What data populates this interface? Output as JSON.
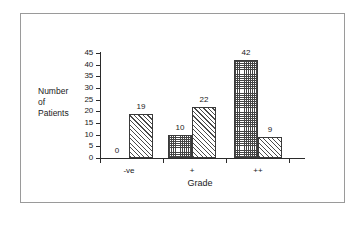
{
  "chart_data": {
    "type": "bar",
    "title": "",
    "subtitle": "",
    "xlabel": "Grade",
    "ylabel": "Number of Patients",
    "ylabel_lines": [
      "Number",
      "of",
      "Patients"
    ],
    "categories": [
      "-ve",
      "+",
      "++"
    ],
    "series": [
      {
        "name": "series-1",
        "pattern": "checkerboard",
        "values": [
          0,
          10,
          42
        ]
      },
      {
        "name": "series-2",
        "pattern": "diagonal-hatch",
        "values": [
          19,
          22,
          9
        ]
      }
    ],
    "ylim": [
      0,
      45
    ],
    "ytick_step": 5,
    "yticks": [
      0,
      5,
      10,
      15,
      20,
      25,
      30,
      35,
      40,
      45
    ],
    "ytick_labels": [
      "0",
      "5",
      "10",
      "15",
      "20",
      "25",
      "30",
      "35",
      "40",
      "45"
    ],
    "data_labels": [
      "0",
      "19",
      "10",
      "22",
      "42",
      "9"
    ],
    "grid": false,
    "legend": "none",
    "colors": {
      "axis": "#2b2b2b",
      "text": "#1a1a1a",
      "bar_outline": "#3a3a3a",
      "frame": "#9a9a9a",
      "background": "#ffffff"
    }
  }
}
